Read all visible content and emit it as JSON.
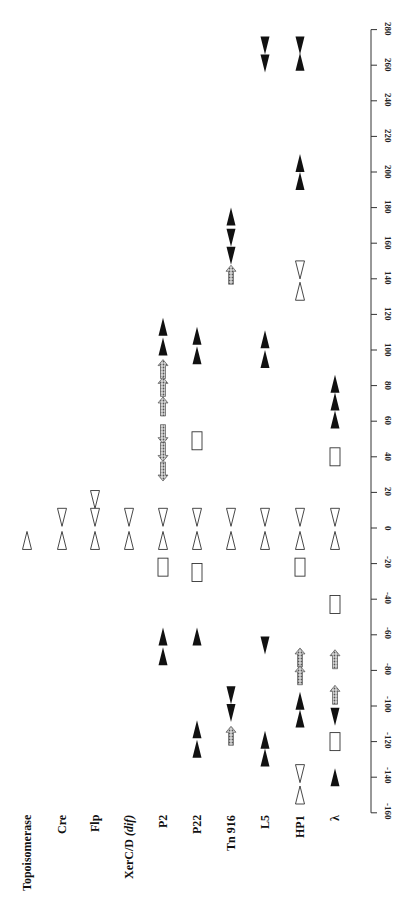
{
  "figure": {
    "axis": {
      "min": -160,
      "max": 280,
      "step": 20,
      "ticks": [
        280,
        260,
        240,
        220,
        200,
        180,
        160,
        140,
        120,
        100,
        80,
        60,
        40,
        20,
        0,
        -20,
        -40,
        -60,
        -80,
        -100,
        -120,
        -140,
        -160
      ]
    },
    "legend_symbols": {
      "open_triangle": "core site half (open triangle)",
      "filled_triangle": "arm-type binding site (filled triangle)",
      "hatched_arrow": "accessory protein binding site (hatched arrow)",
      "open_rectangle": "IHF/accessory site (open rectangle)"
    },
    "colors": {
      "filled": "#111111",
      "hatched": "#9a9a9a",
      "outline": "#333333"
    },
    "tracks": [
      {
        "label": "Topoisomerase",
        "label_italic": "",
        "x": 27,
        "features": [
          {
            "type": "open_up",
            "pos": -7
          }
        ]
      },
      {
        "label": "Cre",
        "label_italic": "",
        "x": 62,
        "features": [
          {
            "type": "open_down",
            "pos": 6
          },
          {
            "type": "open_up",
            "pos": -7
          }
        ]
      },
      {
        "label": "Flp",
        "label_italic": "",
        "x": 95,
        "features": [
          {
            "type": "open_down",
            "pos": 16
          },
          {
            "type": "open_down",
            "pos": 6
          },
          {
            "type": "open_up",
            "pos": -7
          }
        ]
      },
      {
        "label": "XerC/D ",
        "label_italic": "(dif)",
        "x": 129,
        "features": [
          {
            "type": "open_down",
            "pos": 6
          },
          {
            "type": "open_up",
            "pos": -7
          }
        ]
      },
      {
        "label": "P2",
        "label_italic": "",
        "x": 163,
        "features": [
          {
            "type": "filled_up",
            "pos": 113
          },
          {
            "type": "filled_up",
            "pos": 102
          },
          {
            "type": "hatch_up",
            "pos": 89
          },
          {
            "type": "hatch_up",
            "pos": 79
          },
          {
            "type": "hatch_up",
            "pos": 68
          },
          {
            "type": "hatch_down",
            "pos": 53
          },
          {
            "type": "hatch_down",
            "pos": 43
          },
          {
            "type": "hatch_down",
            "pos": 32
          },
          {
            "type": "open_down",
            "pos": 6
          },
          {
            "type": "open_up",
            "pos": -7
          },
          {
            "type": "rect",
            "pos": -22
          },
          {
            "type": "filled_up",
            "pos": -61
          },
          {
            "type": "filled_up",
            "pos": -72
          }
        ]
      },
      {
        "label": "P22",
        "label_italic": "",
        "x": 197,
        "features": [
          {
            "type": "filled_up",
            "pos": 108
          },
          {
            "type": "filled_up",
            "pos": 97
          },
          {
            "type": "rect",
            "pos": 49
          },
          {
            "type": "open_down",
            "pos": 6
          },
          {
            "type": "open_up",
            "pos": -7
          },
          {
            "type": "rect",
            "pos": -25
          },
          {
            "type": "filled_up",
            "pos": -61
          },
          {
            "type": "filled_up",
            "pos": -113
          },
          {
            "type": "filled_up",
            "pos": -124
          }
        ]
      },
      {
        "label": "Tn 916",
        "label_italic": "",
        "x": 231,
        "features": [
          {
            "type": "filled_up",
            "pos": 175
          },
          {
            "type": "filled_down",
            "pos": 163
          },
          {
            "type": "filled_down",
            "pos": 153
          },
          {
            "type": "hatch_up",
            "pos": 142
          },
          {
            "type": "open_down",
            "pos": 6
          },
          {
            "type": "open_up",
            "pos": -7
          },
          {
            "type": "filled_down",
            "pos": -94
          },
          {
            "type": "filled_down",
            "pos": -104
          },
          {
            "type": "hatch_up",
            "pos": -117
          }
        ]
      },
      {
        "label": "L5",
        "label_italic": "",
        "x": 265,
        "features": [
          {
            "type": "filled_down",
            "pos": 271
          },
          {
            "type": "filled_down",
            "pos": 261
          },
          {
            "type": "filled_up",
            "pos": 106
          },
          {
            "type": "filled_up",
            "pos": 95
          },
          {
            "type": "open_down",
            "pos": 6
          },
          {
            "type": "open_up",
            "pos": -7
          },
          {
            "type": "filled_down",
            "pos": -66
          },
          {
            "type": "filled_up",
            "pos": -119
          },
          {
            "type": "filled_up",
            "pos": -129
          }
        ]
      },
      {
        "label": "HP1",
        "label_italic": "",
        "x": 300,
        "features": [
          {
            "type": "filled_down",
            "pos": 271
          },
          {
            "type": "filled_up",
            "pos": 262
          },
          {
            "type": "filled_up",
            "pos": 205
          },
          {
            "type": "filled_up",
            "pos": 195
          },
          {
            "type": "open_down",
            "pos": 145
          },
          {
            "type": "open_up",
            "pos": 133
          },
          {
            "type": "open_down",
            "pos": 6
          },
          {
            "type": "open_up",
            "pos": -7
          },
          {
            "type": "rect",
            "pos": -22
          },
          {
            "type": "hatch_up",
            "pos": -73
          },
          {
            "type": "hatch_up",
            "pos": -83
          },
          {
            "type": "filled_up",
            "pos": -97
          },
          {
            "type": "filled_up",
            "pos": -107
          },
          {
            "type": "open_down",
            "pos": -138
          },
          {
            "type": "open_up",
            "pos": -150
          }
        ]
      },
      {
        "label": "λ",
        "label_italic": "",
        "x": 335,
        "features": [
          {
            "type": "filled_up",
            "pos": 81
          },
          {
            "type": "filled_up",
            "pos": 71
          },
          {
            "type": "filled_up",
            "pos": 61
          },
          {
            "type": "rect",
            "pos": 40
          },
          {
            "type": "open_down",
            "pos": 6
          },
          {
            "type": "open_up",
            "pos": -7
          },
          {
            "type": "rect",
            "pos": -43
          },
          {
            "type": "hatch_up",
            "pos": -74
          },
          {
            "type": "hatch_up",
            "pos": -94
          },
          {
            "type": "filled_down",
            "pos": -106
          },
          {
            "type": "rect",
            "pos": -120
          },
          {
            "type": "filled_up",
            "pos": -140
          }
        ]
      }
    ]
  }
}
